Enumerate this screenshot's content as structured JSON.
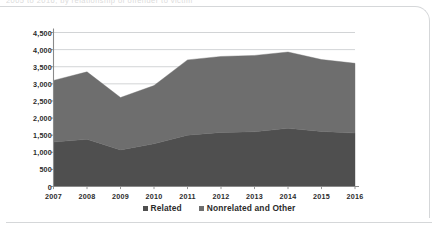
{
  "page": {
    "clipped_text_fragment": "2005 to 2016, by relationship of offender to victim"
  },
  "chart_data": {
    "type": "area",
    "stacked": true,
    "title": "",
    "subtitle": "",
    "xlabel": "",
    "ylabel": "",
    "grid": true,
    "gridlines_horizontal": true,
    "gridlines_vertical": false,
    "legend_position": "bottom-center",
    "categories": [
      "2007",
      "2008",
      "2009",
      "2010",
      "2011",
      "2012",
      "2013",
      "2014",
      "2015",
      "2016"
    ],
    "x_tick_labels": [
      "2007",
      "2008",
      "2009",
      "2010",
      "2011",
      "2012",
      "2013",
      "2014",
      "2015",
      "2016"
    ],
    "ylim": [
      0,
      4500
    ],
    "y_tick_values": [
      0,
      500,
      1000,
      1500,
      2000,
      2500,
      3000,
      3500,
      4000,
      4500
    ],
    "y_tick_labels": [
      "0",
      "500",
      "1,000",
      "1,500",
      "2,000",
      "2,500",
      "3,000",
      "3,500",
      "4,000",
      "4,500"
    ],
    "series": [
      {
        "name": "Related",
        "color": "#4f4f4f",
        "values": [
          1300,
          1380,
          1070,
          1250,
          1500,
          1580,
          1600,
          1700,
          1610,
          1560
        ]
      },
      {
        "name": "Nonrelated and Other",
        "color": "#6e6e6e",
        "values": [
          1800,
          1970,
          1530,
          1700,
          2200,
          2220,
          2230,
          2230,
          2100,
          2040
        ]
      }
    ],
    "stacked_totals": [
      3100,
      3350,
      2600,
      2950,
      3700,
      3800,
      3830,
      3930,
      3710,
      3600
    ]
  },
  "legend": {
    "items": [
      {
        "label": "Related",
        "swatch_color": "#4f4f4f"
      },
      {
        "label": "Nonrelated and Other",
        "swatch_color": "#6e6e6e"
      }
    ]
  },
  "style": {
    "axis_color": "#8a8a8a",
    "gridline_color": "#c6c9cc",
    "text_color": "#2b2b2b",
    "plot_background": "#ffffff",
    "frame_border_color": "#d5d7d9"
  }
}
